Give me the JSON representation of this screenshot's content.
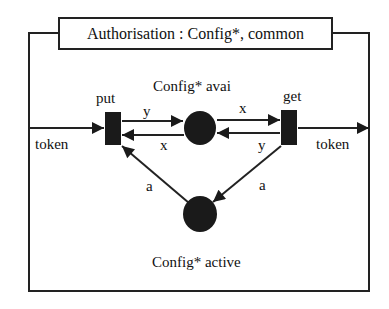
{
  "title": "Authorisation : Config*, common",
  "places": [
    {
      "id": "avail",
      "label": "Config* avai"
    },
    {
      "id": "active",
      "label": "Config* active"
    }
  ],
  "transitions": [
    {
      "id": "put",
      "label": "put"
    },
    {
      "id": "get",
      "label": "get"
    }
  ],
  "arcs": {
    "token_in": "token",
    "token_out": "token",
    "put_to_avail": "y",
    "avail_to_put": "x",
    "avail_to_get": "x",
    "get_to_avail": "y",
    "active_to_put": "a",
    "get_to_active": "a"
  },
  "colors": {
    "stroke": "#222222",
    "fill": "#1a1a1a",
    "background": "#ffffff"
  }
}
